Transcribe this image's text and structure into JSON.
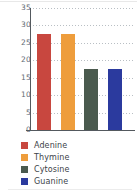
{
  "chart_data": {
    "type": "bar",
    "title": "",
    "subtitle": "",
    "xlabel": "",
    "ylabel": "",
    "categories": [
      "Adenine",
      "Thymine",
      "Cytosine",
      "Guanine"
    ],
    "values": [
      27.5,
      27.5,
      17.5,
      17.5
    ],
    "ylim": [
      0,
      35
    ],
    "ytick_labels": [
      "35",
      "30",
      "25",
      "20",
      "15",
      "10",
      "5",
      "0"
    ],
    "ytick_values": [
      35,
      30,
      25,
      20,
      15,
      10,
      5,
      0
    ],
    "ytick_step": 5,
    "grid": "horizontal-dotted",
    "xtick_labels": [],
    "legend_position": "below-left",
    "legend": [
      {
        "label": "Adenine",
        "color": "#c8473f"
      },
      {
        "label": "Thymine",
        "color": "#ee9d3c"
      },
      {
        "label": "Cytosine",
        "color": "#4a5a4e"
      },
      {
        "label": "Guanine",
        "color": "#2b3a9e"
      }
    ],
    "series": [
      {
        "name": "Base composition",
        "points": [
          {
            "category": "Adenine",
            "value": 27.5,
            "color": "#c8473f"
          },
          {
            "category": "Thymine",
            "value": 27.5,
            "color": "#ee9d3c"
          },
          {
            "category": "Cytosine",
            "value": 17.5,
            "color": "#4a5a4e"
          },
          {
            "category": "Guanine",
            "value": 17.5,
            "color": "#2b3a9e"
          }
        ]
      }
    ],
    "colors": {
      "axis": "#54595e",
      "gridline": "#b9bfc4",
      "tick_label": "#5f6a72",
      "legend_label": "#3d4349",
      "background": "#ffffff"
    }
  }
}
